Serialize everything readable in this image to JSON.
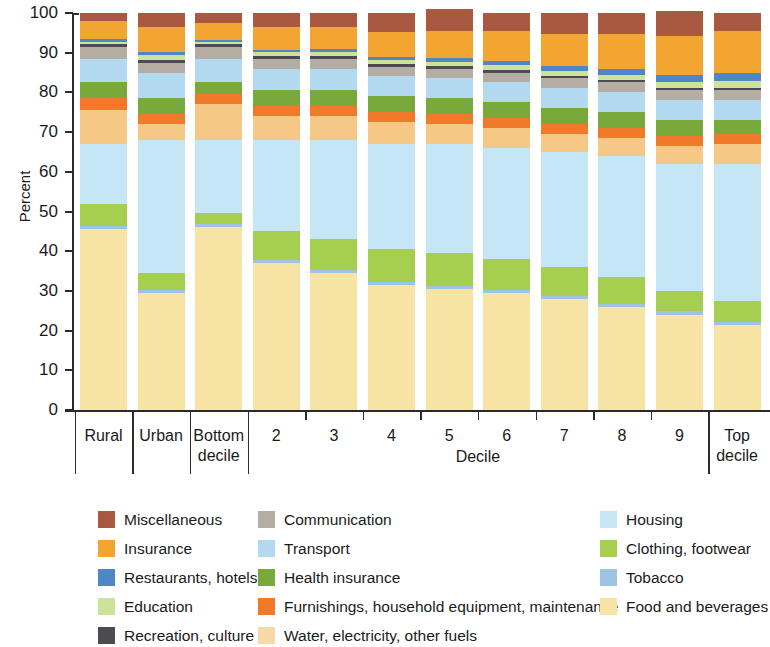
{
  "chart_data": {
    "type": "bar",
    "subtype": "stacked-bar-100",
    "title": "",
    "xlabel": "Decile",
    "ylabel": "Percent",
    "ylim": [
      0,
      100
    ],
    "yticks": [
      0,
      10,
      20,
      30,
      40,
      50,
      60,
      70,
      80,
      90,
      100
    ],
    "ytick_labels": [
      "0",
      "10",
      "20",
      "30",
      "40",
      "50",
      "60",
      "70",
      "80",
      "90",
      "100"
    ],
    "grid": false,
    "legend_position": "bottom",
    "categories": [
      "Rural",
      "Urban",
      "Bottom decile",
      "2",
      "3",
      "4",
      "5",
      "6",
      "7",
      "8",
      "9",
      "Top decile"
    ],
    "stack_order_bottom_to_top": [
      "Food and beverages",
      "Tobacco",
      "Clothing, footwear",
      "Housing",
      "Water, electricity, other fuels",
      "Furnishings, household equipment, maintenance",
      "Health insurance",
      "Transport",
      "Communication",
      "Recreation, culture",
      "Education",
      "Restaurants, hotels",
      "Insurance",
      "Miscellaneous"
    ],
    "series": [
      {
        "name": "Food and beverages",
        "color": "#f7e3a4",
        "values": [
          45.5,
          29.5,
          46.0,
          37.0,
          34.5,
          31.5,
          30.5,
          29.5,
          28.0,
          26.0,
          24.0,
          21.5
        ]
      },
      {
        "name": "Tobacco",
        "color": "#9ec4e3",
        "values": [
          0.8,
          0.8,
          0.8,
          0.8,
          0.8,
          0.8,
          0.8,
          0.8,
          0.8,
          0.8,
          0.8,
          0.7
        ]
      },
      {
        "name": "Clothing, footwear",
        "color": "#a7cf4f",
        "values": [
          5.7,
          4.2,
          2.7,
          7.2,
          7.7,
          8.2,
          8.2,
          7.7,
          7.2,
          6.7,
          5.2,
          5.3
        ]
      },
      {
        "name": "Housing",
        "color": "#c5e6f5",
        "values": [
          15.0,
          33.5,
          18.5,
          23.0,
          25.0,
          26.5,
          27.5,
          28.0,
          29.0,
          30.5,
          32.0,
          34.5
        ]
      },
      {
        "name": "Water, electricity, other fuels",
        "color": "#f5c885",
        "values": [
          8.5,
          4.0,
          9.0,
          6.0,
          6.0,
          5.5,
          5.0,
          5.0,
          4.5,
          4.5,
          4.5,
          5.0
        ]
      },
      {
        "name": "Furnishings, household equipment, maintenance",
        "color": "#f0792a",
        "values": [
          3.0,
          2.5,
          2.5,
          2.5,
          2.5,
          2.5,
          2.5,
          2.5,
          2.5,
          2.5,
          2.5,
          2.5
        ]
      },
      {
        "name": "Health insurance",
        "color": "#79a93a",
        "values": [
          4.0,
          4.0,
          3.0,
          4.0,
          4.0,
          4.0,
          4.0,
          4.0,
          4.0,
          4.0,
          4.0,
          3.5
        ]
      },
      {
        "name": "Transport",
        "color": "#b3d9f0",
        "values": [
          6.0,
          6.5,
          6.0,
          5.5,
          5.5,
          5.0,
          5.0,
          5.0,
          5.0,
          5.0,
          5.0,
          5.0
        ]
      },
      {
        "name": "Communication",
        "color": "#b3ada4",
        "values": [
          3.0,
          2.5,
          3.0,
          2.5,
          2.5,
          2.5,
          2.5,
          2.5,
          2.5,
          2.5,
          2.5,
          2.5
        ]
      },
      {
        "name": "Recreation, culture",
        "color": "#4e4a52",
        "values": [
          0.6,
          0.6,
          0.6,
          0.6,
          0.6,
          0.6,
          0.6,
          0.6,
          0.6,
          0.6,
          0.6,
          0.6
        ]
      },
      {
        "name": "Education",
        "color": "#cbe39a",
        "values": [
          0.5,
          1.2,
          0.6,
          1.0,
          1.0,
          1.0,
          1.1,
          1.2,
          1.3,
          1.4,
          1.6,
          1.8
        ]
      },
      {
        "name": "Restaurants, hotels",
        "color": "#4f86c6",
        "values": [
          0.9,
          0.9,
          0.6,
          0.7,
          0.8,
          0.9,
          1.0,
          1.1,
          1.2,
          1.4,
          1.6,
          2.0
        ]
      },
      {
        "name": "Insurance",
        "color": "#f2a531",
        "values": [
          4.5,
          6.3,
          4.2,
          5.7,
          5.6,
          6.3,
          6.8,
          7.5,
          8.1,
          8.7,
          10.0,
          10.5
        ]
      },
      {
        "name": "Miscellaneous",
        "color": "#a9593f",
        "values": [
          2.0,
          3.5,
          2.5,
          3.5,
          3.5,
          4.7,
          5.5,
          4.6,
          5.3,
          5.4,
          6.3,
          4.6
        ]
      }
    ]
  },
  "axis": {
    "ylabel": "Percent",
    "xlabel": "Decile",
    "ytick_labels": [
      "100",
      "90",
      "80",
      "70",
      "60",
      "50",
      "40",
      "30",
      "20",
      "10",
      "0"
    ],
    "category_labels": [
      {
        "line1": "Rural",
        "line2": ""
      },
      {
        "line1": "Urban",
        "line2": ""
      },
      {
        "line1": "Bottom",
        "line2": "decile"
      },
      {
        "line1": "2",
        "line2": ""
      },
      {
        "line1": "3",
        "line2": ""
      },
      {
        "line1": "4",
        "line2": ""
      },
      {
        "line1": "5",
        "line2": ""
      },
      {
        "line1": "6",
        "line2": ""
      },
      {
        "line1": "7",
        "line2": ""
      },
      {
        "line1": "8",
        "line2": ""
      },
      {
        "line1": "9",
        "line2": ""
      },
      {
        "line1": "Top",
        "line2": "decile"
      }
    ]
  },
  "legend": {
    "columns": [
      [
        {
          "label": "Miscellaneous",
          "color": "#a9593f"
        },
        {
          "label": "Insurance",
          "color": "#f2a531"
        },
        {
          "label": "Restaurants, hotels",
          "color": "#4f86c6"
        },
        {
          "label": "Education",
          "color": "#cbe39a"
        },
        {
          "label": "Recreation, culture",
          "color": "#4e4a52"
        }
      ],
      [
        {
          "label": "Communication",
          "color": "#b3ada4"
        },
        {
          "label": "Transport",
          "color": "#b3d9f0"
        },
        {
          "label": "Health insurance",
          "color": "#79a93a"
        },
        {
          "label": "Furnishings, household equipment, maintenance",
          "color": "#f0792a"
        },
        {
          "label": "Water, electricity, other fuels",
          "color": "#f7d9a8"
        }
      ],
      [
        {
          "label": "Housing",
          "color": "#c5e6f5"
        },
        {
          "label": "Clothing, footwear",
          "color": "#a7cf4f"
        },
        {
          "label": "Tobacco",
          "color": "#9ec4e3"
        },
        {
          "label": "Food and beverages",
          "color": "#f7e3a4"
        }
      ]
    ]
  }
}
